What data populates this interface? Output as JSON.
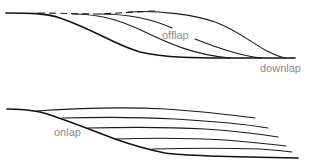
{
  "diagram": {
    "panels": [
      {
        "id": "offlap-panel",
        "labels": {
          "offlap": "offlap",
          "downlap": "downlap"
        }
      },
      {
        "id": "onlap-panel",
        "labels": {
          "onlap": "onlap"
        }
      }
    ],
    "colors": {
      "line": "#1a1a1a",
      "label": "#8a8a8a",
      "background": "#ffffff"
    }
  }
}
